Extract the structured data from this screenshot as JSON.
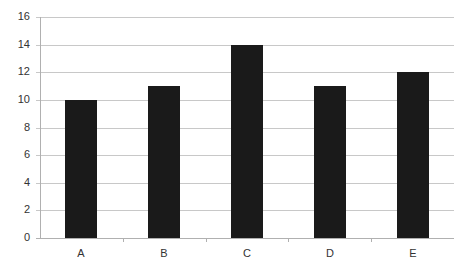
{
  "chart_data": {
    "type": "bar",
    "title": "",
    "xlabel": "",
    "ylabel": "",
    "categories": [
      "A",
      "B",
      "C",
      "D",
      "E"
    ],
    "values": [
      10,
      11,
      14,
      11,
      12
    ],
    "ylim": [
      0,
      16
    ],
    "yticks": [
      0,
      2,
      4,
      6,
      8,
      10,
      12,
      14,
      16
    ],
    "grid": true,
    "legend": null,
    "bar_color": "#1a1a1a",
    "grid_color": "#c8c8c8"
  }
}
